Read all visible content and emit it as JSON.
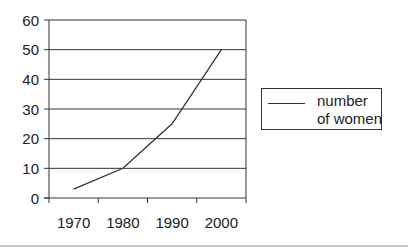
{
  "chart_data": {
    "type": "line",
    "title": "",
    "xlabel": "",
    "ylabel": "",
    "categories": [
      "1970",
      "1980",
      "1990",
      "2000"
    ],
    "series": [
      {
        "name": "number of women",
        "values": [
          3,
          10,
          25,
          50
        ],
        "color": "#333333"
      }
    ],
    "ylim": [
      0,
      60
    ],
    "yticks": [
      0,
      10,
      20,
      30,
      40,
      50,
      60
    ],
    "grid": {
      "horizontal": true,
      "vertical": false
    },
    "legend": {
      "position": "right",
      "entries": [
        "number of women"
      ]
    }
  },
  "legend": {
    "label": "number of women"
  }
}
